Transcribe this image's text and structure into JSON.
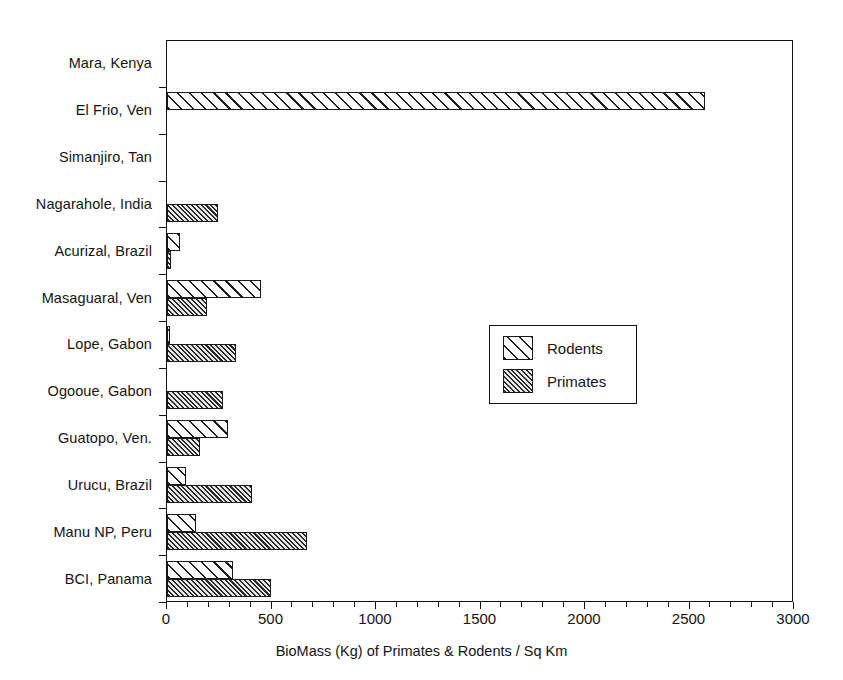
{
  "chart_data": {
    "type": "bar",
    "orientation": "horizontal",
    "title": "",
    "xlabel": "BioMass (Kg) of Primates & Rodents / Sq Km",
    "ylabel": "",
    "xlim": [
      0,
      3000
    ],
    "xticks": [
      0,
      500,
      1000,
      1500,
      2000,
      2500,
      3000
    ],
    "xtick_labels": [
      "0",
      "500",
      "1000",
      "1500",
      "2000",
      "2500",
      "3000"
    ],
    "minor_tick_step": 100,
    "grid": false,
    "legend_position": "center-right",
    "categories": [
      "Mara, Kenya",
      "El Frio, Ven",
      "Simanjiro, Tan",
      "Nagarahole, India",
      "Acurizal, Brazil",
      "Masaguaral, Ven",
      "Lope, Gabon",
      "Ogooue, Gabon",
      "Guatopo, Ven.",
      "Urucu, Brazil",
      "Manu NP, Peru",
      "BCI, Panama"
    ],
    "series": [
      {
        "name": "Rodents",
        "values": [
          0,
          2574,
          0,
          0,
          60,
          450,
          8,
          0,
          292,
          91,
          139,
          316
        ]
      },
      {
        "name": "Primates",
        "values": [
          0,
          0,
          0,
          245,
          20,
          191,
          330,
          268,
          158,
          406,
          670,
          498
        ]
      }
    ]
  },
  "legend": {
    "items": [
      {
        "label": "Rodents",
        "pattern": "wide-diagonal-hatch"
      },
      {
        "label": "Primates",
        "pattern": "dense-diagonal-hatch"
      }
    ]
  }
}
